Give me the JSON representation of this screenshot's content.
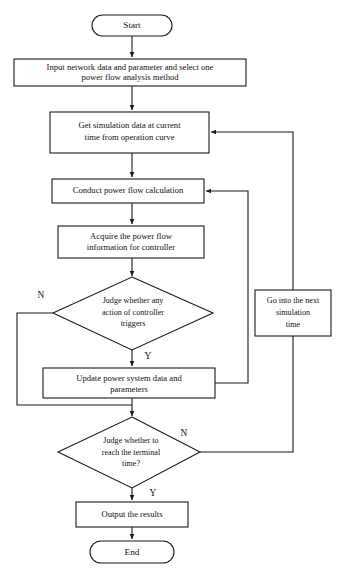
{
  "diagram": {
    "type": "flowchart",
    "colors": {
      "background": "#ffffff",
      "stroke": "#1a1a1a",
      "text": "#111111",
      "node_fill": "#ffffff"
    },
    "nodes": [
      {
        "id": "start",
        "shape": "terminator",
        "label": "Start",
        "lines": [
          "Start"
        ]
      },
      {
        "id": "input-data",
        "shape": "process",
        "label": "Input network data and parameter and select one power flow analysis method",
        "lines": [
          "Input network data and parameter and select one",
          "power flow analysis method"
        ]
      },
      {
        "id": "get-simulation-data",
        "shape": "process",
        "label": "Get simulation data at current time from operation curve",
        "lines": [
          "Get simulation data at current",
          "time from operation curve"
        ]
      },
      {
        "id": "conduct-power-flow",
        "shape": "process",
        "label": "Conduct power flow calculation",
        "lines": [
          "Conduct power flow calculation"
        ]
      },
      {
        "id": "acquire-power-flow-info",
        "shape": "process",
        "label": "Acquire the power flow information for controller",
        "lines": [
          "Acquire the power flow",
          "information for controller"
        ]
      },
      {
        "id": "judge-controller-action",
        "shape": "decision",
        "label": "Judge whether any action of controller triggers",
        "lines": [
          "Judge whether any",
          "action of controller",
          "triggers"
        ]
      },
      {
        "id": "update-system-data",
        "shape": "process",
        "label": "Update power system data and parameters",
        "lines": [
          "Update power system data and",
          "parameters"
        ]
      },
      {
        "id": "judge-terminal-time",
        "shape": "decision",
        "label": "Judge whether to reach the terminal time?",
        "lines": [
          "Judge whether to",
          "reach the terminal",
          "time?"
        ]
      },
      {
        "id": "go-next-simulation-time",
        "shape": "process",
        "label": "Go into the next simulation time",
        "lines": [
          "Go into the next",
          "simulation",
          "time"
        ]
      },
      {
        "id": "output-results",
        "shape": "process",
        "label": "Output the results",
        "lines": [
          "Output the results"
        ]
      },
      {
        "id": "end",
        "shape": "terminator",
        "label": "End",
        "lines": [
          "End"
        ]
      }
    ],
    "branch_labels": {
      "controller_no": "N",
      "controller_yes": "Y",
      "terminal_no": "N",
      "terminal_yes": "Y"
    },
    "edges": [
      {
        "from": "start",
        "to": "input-data",
        "label": ""
      },
      {
        "from": "input-data",
        "to": "get-simulation-data",
        "label": ""
      },
      {
        "from": "get-simulation-data",
        "to": "conduct-power-flow",
        "label": ""
      },
      {
        "from": "conduct-power-flow",
        "to": "acquire-power-flow-info",
        "label": ""
      },
      {
        "from": "acquire-power-flow-info",
        "to": "judge-controller-action",
        "label": ""
      },
      {
        "from": "judge-controller-action",
        "to": "update-system-data",
        "label": "Y"
      },
      {
        "from": "judge-controller-action",
        "to": "judge-terminal-time",
        "label": "N"
      },
      {
        "from": "update-system-data",
        "to": "conduct-power-flow",
        "label": ""
      },
      {
        "from": "update-system-data",
        "to": "judge-terminal-time",
        "label": ""
      },
      {
        "from": "judge-terminal-time",
        "to": "go-next-simulation-time",
        "label": "N"
      },
      {
        "from": "go-next-simulation-time",
        "to": "get-simulation-data",
        "label": ""
      },
      {
        "from": "judge-terminal-time",
        "to": "output-results",
        "label": "Y"
      },
      {
        "from": "output-results",
        "to": "end",
        "label": ""
      }
    ]
  }
}
